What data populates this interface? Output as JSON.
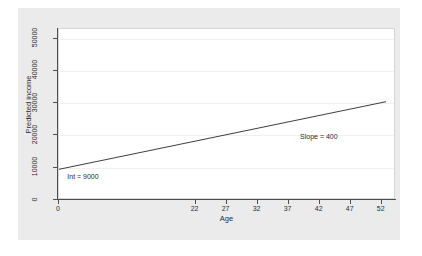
{
  "chart_data": {
    "type": "line",
    "title": "",
    "xlabel": "Age",
    "ylabel": "Predicted income",
    "xlim": [
      0,
      54.3
    ],
    "ylim": [
      0,
      53000
    ],
    "xticks": [
      0,
      22,
      27,
      32,
      37,
      42,
      47,
      52
    ],
    "xticklabels": [
      "0",
      "22",
      "27",
      "32",
      "37",
      "42",
      "47",
      "52"
    ],
    "yticks": [
      0,
      10000,
      20000,
      30000,
      40000,
      50000
    ],
    "yticklabels": [
      "0",
      "10000",
      "20000",
      "30000",
      "40000",
      "50000"
    ],
    "grid": "horizontal",
    "legend": "none",
    "series": [
      {
        "name": "Predicted income",
        "x": [
          0,
          53
        ],
        "values": [
          9000,
          30200
        ],
        "color": "#3c3c3c",
        "equation": "income = 9000 + 400 * age",
        "intercept": 9000,
        "slope": 400
      }
    ],
    "annotations": [
      {
        "text": "Int = 9000",
        "x": 1.5,
        "y": 6600
      },
      {
        "text": "Slope = 400",
        "x": 39,
        "y": 19000
      }
    ]
  },
  "figure": {
    "background_color": "#ebebeb",
    "plot_background_color": "#ffffff",
    "axis_color": "#4d4d4d",
    "gridline_color": "#f0f0f0",
    "line_color": "#3c3c3c"
  }
}
